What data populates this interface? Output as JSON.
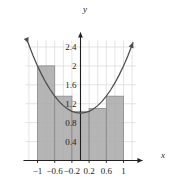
{
  "figure": {
    "name": "riemann-sum-parabola-figure",
    "axis_labels": {
      "x": "x",
      "y": "y"
    },
    "colors": {
      "bar_fill": "#a8a8a8",
      "bar_edge": "#8a8a8a",
      "curve": "#4d4d4d",
      "axis": "#231f20",
      "grid": "#d9d9d9",
      "text": "#231f20"
    }
  },
  "chart_data": {
    "type": "bar",
    "title": "",
    "xlabel": "x",
    "ylabel": "y",
    "xlim": [
      -1.28,
      1.3
    ],
    "ylim": [
      0,
      2.62
    ],
    "grid": true,
    "legend": "none",
    "xticks": [
      -1,
      -0.6,
      -0.2,
      0.2,
      0.6,
      1
    ],
    "xtick_labels": [
      "−1",
      "−0.6",
      "−0.2",
      "0.2",
      "0.6",
      "1"
    ],
    "yticks": [
      0.4,
      0.8,
      1.2,
      1.6,
      2,
      2.4
    ],
    "ytick_labels": [
      "0.4",
      "0.8",
      "1.2",
      "1.6",
      "2",
      "2.4"
    ],
    "bar_edges": [
      -1,
      -0.6,
      -0.2,
      0.2,
      0.6,
      1
    ],
    "bar_width": 0.4,
    "categories": [
      "[-1,-0.6]",
      "[-0.6,-0.2]",
      "[-0.2,0.2]",
      "[0.2,0.6]",
      "[0.6,1]"
    ],
    "values": [
      2.0,
      1.36,
      1.04,
      1.1,
      1.36
    ],
    "series": [
      {
        "name": "Riemann rectangles",
        "values": [
          2.0,
          1.36,
          1.04,
          1.1,
          1.36
        ]
      }
    ],
    "curve": {
      "name": "y = x² + 1",
      "x": [
        -1.22,
        -1.1,
        -1.0,
        -0.9,
        -0.8,
        -0.7,
        -0.6,
        -0.5,
        -0.4,
        -0.3,
        -0.2,
        -0.1,
        0,
        0.1,
        0.2,
        0.3,
        0.4,
        0.5,
        0.6,
        0.7,
        0.8,
        0.9,
        1.0,
        1.1,
        1.22
      ],
      "y": [
        2.49,
        2.21,
        2.0,
        1.81,
        1.64,
        1.49,
        1.36,
        1.25,
        1.16,
        1.09,
        1.04,
        1.01,
        1.0,
        1.01,
        1.04,
        1.09,
        1.16,
        1.25,
        1.36,
        1.49,
        1.64,
        1.81,
        2.0,
        2.21,
        2.49
      ],
      "arrow_start": true,
      "arrow_end": true
    },
    "axes_arrows": {
      "x_positive": true,
      "y_positive": true
    }
  }
}
